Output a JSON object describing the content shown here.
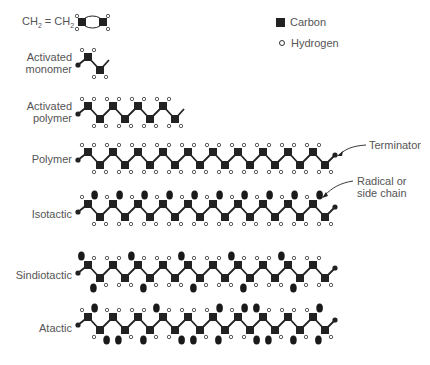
{
  "formula": {
    "left": "CH",
    "left_sub": "2",
    "eq": " = ",
    "right": "CH",
    "right_sub": "2"
  },
  "legend": {
    "carbon_label": "Carbon",
    "hydrogen_label": "Hydrogen"
  },
  "labels": {
    "activated_monomer": [
      "Activated",
      "monomer"
    ],
    "activated_polymer": [
      "Activated",
      "polymer"
    ],
    "polymer": "Polymer",
    "isotactic": "Isotactic",
    "sindiotactic": "Sindiotactic",
    "atactic": "Atactic"
  },
  "annotations": {
    "terminator": "Terminator",
    "radical": [
      "Radical or",
      "side chain"
    ]
  },
  "colors": {
    "carbon": "#222222",
    "bond": "#222222",
    "hydrogen_stroke": "#333333",
    "radical": "#1a1a1a",
    "text": "#555555"
  },
  "chains": [
    {
      "name": "activated-monomer",
      "upper_y": 57,
      "lower_y": 70,
      "periods": 1,
      "start_dot": true,
      "end": "open",
      "upper": [
        "HH"
      ],
      "lower": [
        "HH"
      ]
    },
    {
      "name": "activated-polymer",
      "upper_y": 106,
      "lower_y": 119,
      "periods": 4,
      "start_dot": true,
      "end": "open",
      "upper": [
        "HH",
        "HH",
        "HH",
        "HH"
      ],
      "lower": [
        "HH",
        "HH",
        "HH",
        "HH"
      ]
    },
    {
      "name": "polymer",
      "upper_y": 152,
      "lower_y": 165,
      "periods": 10,
      "start_dot": true,
      "end": "dot",
      "upper": [
        "HH",
        "HH",
        "HH",
        "HH",
        "HH",
        "HH",
        "HH",
        "HH",
        "HH",
        "HH"
      ],
      "lower": [
        "HH",
        "HH",
        "HH",
        "HH",
        "HH",
        "HH",
        "HH",
        "HH",
        "HH",
        "HH"
      ]
    },
    {
      "name": "isotactic",
      "upper_y": 204,
      "lower_y": 217,
      "periods": 10,
      "start_dot": true,
      "end": "dot",
      "upper": [
        "HR",
        "HR",
        "HR",
        "HR",
        "HR",
        "HR",
        "HR",
        "HR",
        "HR",
        "HR"
      ],
      "lower": [
        "HH",
        "HH",
        "HH",
        "HH",
        "HH",
        "HH",
        "HH",
        "HH",
        "HH",
        "HH"
      ]
    },
    {
      "name": "sindiotactic",
      "upper_y": 265,
      "lower_y": 278,
      "periods": 10,
      "start_dot": true,
      "end": "dot",
      "upper": [
        "RH",
        "HH",
        "RH",
        "HH",
        "RH",
        "HH",
        "RH",
        "HH",
        "RH",
        "HH"
      ],
      "lower": [
        "RH",
        "HH",
        "RH",
        "HH",
        "RH",
        "HH",
        "RH",
        "HH",
        "RH",
        "HH"
      ]
    },
    {
      "name": "atactic",
      "upper_y": 317,
      "lower_y": 330,
      "periods": 10,
      "start_dot": true,
      "end": "dot",
      "upper": [
        "HR",
        "HH",
        "HH",
        "RH",
        "HH",
        "HR",
        "HR",
        "RH",
        "HH",
        "HR"
      ],
      "lower": [
        "HR",
        "RH",
        "RH",
        "HR",
        "RH",
        "RH",
        "HR",
        "RH",
        "RH",
        "RH"
      ]
    }
  ]
}
